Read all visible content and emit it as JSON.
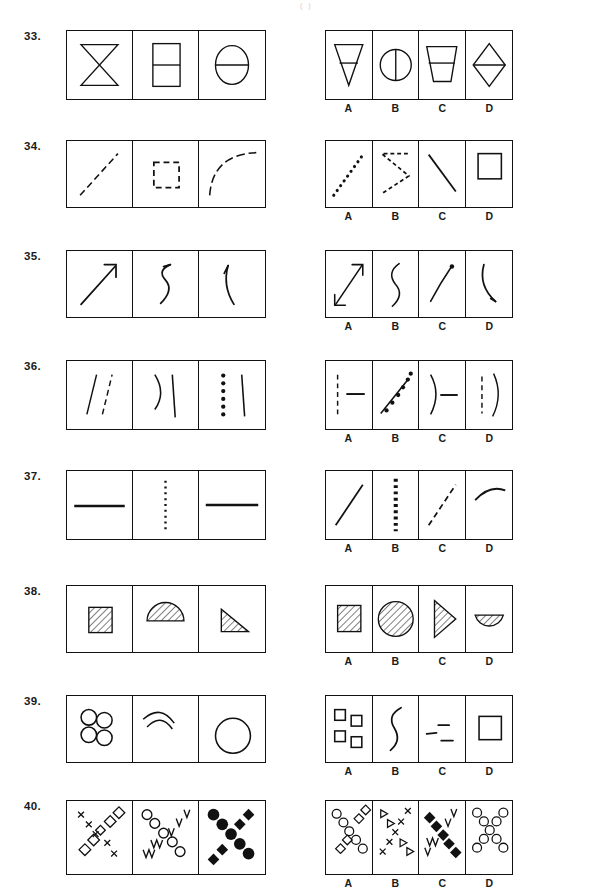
{
  "document": {
    "type": "abstract-reasoning-test-page",
    "top_mark": "( )",
    "option_labels": [
      "A",
      "B",
      "C",
      "D"
    ],
    "stem_panel_count": 3,
    "option_panel_count": 4
  },
  "questions": [
    {
      "number": "33.",
      "top": 30,
      "stem": {
        "width": 200,
        "height": 70,
        "cells": [
          {
            "name": "bowtie-hourglass",
            "desc": "hourglass / bowtie formed by two triangles"
          },
          {
            "name": "rectangle-split-horizontal",
            "desc": "rectangle divided by horizontal line"
          },
          {
            "name": "circle-split-horizontal",
            "desc": "circle divided by horizontal line"
          }
        ]
      },
      "options": {
        "width": 188,
        "height": 70,
        "cells": [
          {
            "label": "A",
            "name": "triangle-down-split",
            "desc": "downward triangle with horizontal line"
          },
          {
            "label": "B",
            "name": "circle-split-vertical",
            "desc": "circle divided by vertical line"
          },
          {
            "label": "C",
            "name": "trapezoid-split",
            "desc": "trapezoid with horizontal line"
          },
          {
            "label": "D",
            "name": "diamond-split-horizontal",
            "desc": "diamond with horizontal line"
          }
        ]
      }
    },
    {
      "number": "34.",
      "top": 140,
      "stem": {
        "width": 200,
        "height": 68,
        "cells": [
          {
            "name": "dashed-diagonal-line",
            "desc": "dashed line rising to the right"
          },
          {
            "name": "dashed-square",
            "desc": "square drawn with dashes"
          },
          {
            "name": "dashed-arc",
            "desc": "dashed concave arc"
          }
        ]
      },
      "options": {
        "width": 188,
        "height": 68,
        "cells": [
          {
            "label": "A",
            "name": "dotted-diagonal-line",
            "desc": "dotted line rising to the right"
          },
          {
            "label": "B",
            "name": "dotted-zigzag",
            "desc": "dotted sideways Z / zigzag"
          },
          {
            "label": "C",
            "name": "solid-diagonal-line",
            "desc": "solid line falling to the right"
          },
          {
            "label": "D",
            "name": "solid-square",
            "desc": "solid outlined square"
          }
        ]
      }
    },
    {
      "number": "35.",
      "top": 250,
      "stem": {
        "width": 200,
        "height": 68,
        "cells": [
          {
            "name": "arrow-up-right",
            "desc": "straight arrow pointing up-right"
          },
          {
            "name": "squiggle-arrow",
            "desc": "curved squiggle with arrow head"
          },
          {
            "name": "curved-arrow-up",
            "desc": "curved line with arrow head at top"
          }
        ]
      },
      "options": {
        "width": 188,
        "height": 68,
        "cells": [
          {
            "label": "A",
            "name": "double-headed-arrow",
            "desc": "double headed diagonal arrow"
          },
          {
            "label": "B",
            "name": "s-curve",
            "desc": "plain S-shaped curve, no arrow head"
          },
          {
            "label": "C",
            "name": "curve-with-dot",
            "desc": "curve ending in a dot"
          },
          {
            "label": "D",
            "name": "curved-arrow-down",
            "desc": "curved line with arrow head at bottom"
          }
        ]
      }
    },
    {
      "number": "36.",
      "top": 360,
      "stem": {
        "width": 200,
        "height": 70,
        "cells": [
          {
            "name": "solid-line-and-dashed-line",
            "desc": "solid slanted line beside dashed slanted line"
          },
          {
            "name": "arc-and-solid-line",
            "desc": "arc beside a solid vertical line"
          },
          {
            "name": "dotted-line-and-solid-line",
            "desc": "column of dots beside a solid line"
          }
        ]
      },
      "options": {
        "width": 188,
        "height": 70,
        "cells": [
          {
            "label": "A",
            "name": "dashed-vertical-and-horizontal-line",
            "desc": "dashed vertical line beside short horizontal line"
          },
          {
            "label": "B",
            "name": "solid-line-and-dotted-line",
            "desc": "slanted solid line with dotted line"
          },
          {
            "label": "C",
            "name": "arc-and-horizontal-line",
            "desc": "arc beside short horizontal line"
          },
          {
            "label": "D",
            "name": "dashed-line-and-arc",
            "desc": "dashed line beside an arc"
          }
        ]
      }
    },
    {
      "number": "37.",
      "top": 470,
      "stem": {
        "width": 200,
        "height": 70,
        "cells": [
          {
            "name": "solid-horizontal-line",
            "desc": "thick solid horizontal line"
          },
          {
            "name": "dotted-vertical-line",
            "desc": "dotted vertical line"
          },
          {
            "name": "solid-horizontal-line-2",
            "desc": "thick solid horizontal line"
          }
        ]
      },
      "options": {
        "width": 188,
        "height": 70,
        "cells": [
          {
            "label": "A",
            "name": "solid-diagonal-line",
            "desc": "solid diagonal line rising right"
          },
          {
            "label": "B",
            "name": "dotted-vertical-line",
            "desc": "thick dotted vertical line"
          },
          {
            "label": "C",
            "name": "dashed-diagonal-line",
            "desc": "dashed diagonal line rising right"
          },
          {
            "label": "D",
            "name": "solid-arc",
            "desc": "solid shallow arc"
          }
        ]
      }
    },
    {
      "number": "38.",
      "top": 585,
      "stem": {
        "width": 200,
        "height": 68,
        "cells": [
          {
            "name": "hatched-square-small",
            "desc": "small square with diagonal hatching"
          },
          {
            "name": "hatched-semicircle",
            "desc": "semicircle with diagonal hatching"
          },
          {
            "name": "hatched-triangle",
            "desc": "right triangle with diagonal hatching"
          }
        ]
      },
      "options": {
        "width": 188,
        "height": 68,
        "cells": [
          {
            "label": "A",
            "name": "hatched-square",
            "desc": "square with diagonal hatching"
          },
          {
            "label": "B",
            "name": "hatched-circle",
            "desc": "large circle with diagonal hatching"
          },
          {
            "label": "C",
            "name": "hatched-triangle-right",
            "desc": "narrow triangle pointing right, hatched"
          },
          {
            "label": "D",
            "name": "hatched-semicircle-down",
            "desc": "downward semicircle, hatched"
          }
        ]
      }
    },
    {
      "number": "39.",
      "top": 695,
      "stem": {
        "width": 200,
        "height": 68,
        "cells": [
          {
            "name": "four-circles-cluster",
            "desc": "four small circles in a cluster"
          },
          {
            "name": "nested-arcs",
            "desc": "two nested arcs"
          },
          {
            "name": "single-large-circle",
            "desc": "one large circle"
          }
        ]
      },
      "options": {
        "width": 188,
        "height": 68,
        "cells": [
          {
            "label": "A",
            "name": "four-squares-cluster",
            "desc": "four small squares in a cluster"
          },
          {
            "label": "B",
            "name": "brace-curve",
            "desc": "curly brace shaped curve"
          },
          {
            "label": "C",
            "name": "three-short-dashes",
            "desc": "three short horizontal dashes"
          },
          {
            "label": "D",
            "name": "single-square",
            "desc": "one square"
          }
        ]
      }
    },
    {
      "number": "40.",
      "top": 800,
      "stem": {
        "width": 200,
        "height": 75,
        "cells": [
          {
            "name": "x-cross-of-crosses-and-diamonds",
            "desc": "X pattern of small x marks and open diamonds"
          },
          {
            "name": "x-cross-of-circles-and-zigzags",
            "desc": "X pattern of open circles and zigzag marks"
          },
          {
            "name": "x-cross-of-filled-circles-and-diamonds",
            "desc": "X pattern of filled circles and filled diamonds"
          }
        ]
      },
      "options": {
        "width": 188,
        "height": 75,
        "cells": [
          {
            "label": "A",
            "name": "x-cross-of-circles-and-open-diamonds",
            "desc": "X of open circles and open diamonds"
          },
          {
            "label": "B",
            "name": "x-cross-of-triangles-and-crosses",
            "desc": "X of open triangles and x marks"
          },
          {
            "label": "C",
            "name": "x-cross-of-filled-diamonds-and-zigzags",
            "desc": "X of filled diamonds and zigzags"
          },
          {
            "label": "D",
            "name": "x-cross-of-open-circles",
            "desc": "X made entirely of open circles"
          }
        ]
      }
    }
  ]
}
